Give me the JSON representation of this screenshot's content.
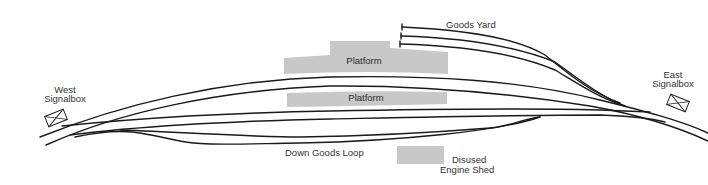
{
  "diagram": {
    "labels": {
      "west_signalbox_line1": "West",
      "west_signalbox_line2": "Signalbox",
      "east_signalbox_line1": "East",
      "east_signalbox_line2": "Signalbox",
      "goods_yard": "Goods Yard",
      "platform_upper": "Platform",
      "platform_lower": "Platform",
      "down_goods_loop": "Down Goods Loop",
      "disused_engine_shed_line1": "Disused",
      "disused_engine_shed_line2": "Engine Shed"
    },
    "colors": {
      "track": "#1a1a1a",
      "platform": "#c8c8c8",
      "text": "#333333",
      "background": "#ffffff"
    }
  }
}
